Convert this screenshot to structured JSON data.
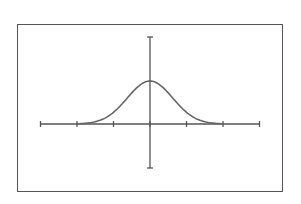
{
  "chart_data": {
    "type": "line",
    "title": "",
    "xlabel": "",
    "ylabel": "",
    "x_ticks": [
      -3,
      -2,
      -1,
      0,
      1,
      2,
      3
    ],
    "tick_labels_shown": false,
    "xlim": [
      -3,
      3
    ],
    "ylim": [
      -1,
      1
    ],
    "grid": false,
    "legend": null,
    "series": [
      {
        "name": "normal-curve",
        "x": [
          -3,
          -2.5,
          -2,
          -1.5,
          -1,
          -0.5,
          0,
          0.5,
          1,
          1.5,
          2,
          2.5,
          3
        ],
        "y": [
          0.0,
          0.01,
          0.05,
          0.2,
          0.45,
          0.8,
          1.0,
          0.8,
          0.45,
          0.2,
          0.05,
          0.01,
          0.0
        ]
      }
    ],
    "colors": {
      "axis": "#555555",
      "curve": "#666666",
      "frame": "#555555"
    }
  }
}
